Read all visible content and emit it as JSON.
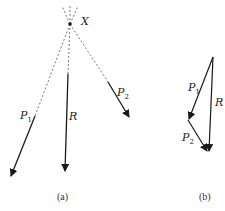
{
  "panel_a": {
    "caption": "(a)",
    "point_label": "X",
    "vectors": [
      {
        "name": "P",
        "sub": "1"
      },
      {
        "name": "R",
        "sub": ""
      },
      {
        "name": "P",
        "sub": "2"
      }
    ]
  },
  "panel_b": {
    "caption": "(b)",
    "vectors": [
      {
        "name": "P",
        "sub": "1"
      },
      {
        "name": "R",
        "sub": ""
      },
      {
        "name": "P",
        "sub": "2"
      }
    ]
  },
  "colors": {
    "stroke": "#1a1a1a",
    "dashed": "#555555"
  }
}
